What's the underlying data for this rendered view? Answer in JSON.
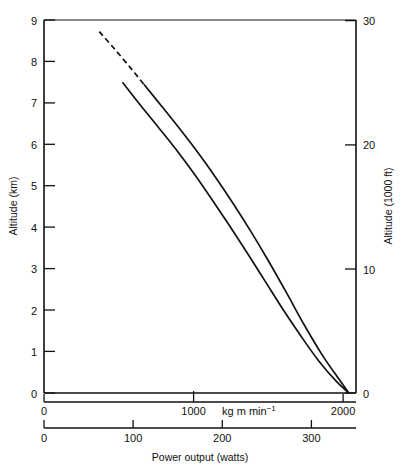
{
  "chart_data": {
    "type": "line",
    "title": "",
    "xlabel": "Power output  (watts)",
    "ylabel": "Altitude  (km)",
    "y2label": "Altitude  (1000 ft)",
    "x2label": "kg m min",
    "x2label_sup": "−1",
    "xlim": [
      0,
      350
    ],
    "ylim": [
      0,
      9
    ],
    "y2lim": [
      0,
      30
    ],
    "x2lim": [
      0,
      2100
    ],
    "grid": false,
    "legend": false,
    "x_ticks": [
      0,
      100,
      200,
      300
    ],
    "x_tick_labels": [
      "0",
      "100",
      "200",
      "300"
    ],
    "x2_ticks": [
      0,
      1000,
      2000
    ],
    "x2_tick_labels": [
      "0",
      "1000",
      "2000"
    ],
    "y_ticks": [
      0,
      1,
      2,
      3,
      4,
      5,
      6,
      7,
      8,
      9
    ],
    "y_tick_labels": [
      "0",
      "1",
      "2",
      "3",
      "4",
      "5",
      "6",
      "7",
      "8",
      "9"
    ],
    "y2_ticks": [
      0,
      10,
      20,
      30
    ],
    "y2_tick_labels": [
      "0",
      "10",
      "20",
      "30"
    ],
    "series": [
      {
        "name": "upper-curve",
        "style": "solid-with-dashed-extension",
        "dashed_segment": [
          {
            "x": 62,
            "y": 8.72
          },
          {
            "x": 80,
            "y": 8.28
          },
          {
            "x": 98,
            "y": 7.82
          },
          {
            "x": 112,
            "y": 7.45
          }
        ],
        "solid_segment": [
          {
            "x": 112,
            "y": 7.45
          },
          {
            "x": 132,
            "y": 6.92
          },
          {
            "x": 152,
            "y": 6.38
          },
          {
            "x": 172,
            "y": 5.82
          },
          {
            "x": 192,
            "y": 5.22
          },
          {
            "x": 212,
            "y": 4.58
          },
          {
            "x": 232,
            "y": 3.9
          },
          {
            "x": 252,
            "y": 3.18
          },
          {
            "x": 272,
            "y": 2.42
          },
          {
            "x": 292,
            "y": 1.64
          },
          {
            "x": 312,
            "y": 0.92
          },
          {
            "x": 330,
            "y": 0.36
          },
          {
            "x": 342,
            "y": 0.0
          }
        ]
      },
      {
        "name": "lower-curve",
        "style": "solid",
        "solid_segment": [
          {
            "x": 88,
            "y": 7.5
          },
          {
            "x": 108,
            "y": 6.95
          },
          {
            "x": 128,
            "y": 6.42
          },
          {
            "x": 148,
            "y": 5.88
          },
          {
            "x": 168,
            "y": 5.3
          },
          {
            "x": 188,
            "y": 4.68
          },
          {
            "x": 208,
            "y": 4.04
          },
          {
            "x": 228,
            "y": 3.38
          },
          {
            "x": 248,
            "y": 2.7
          },
          {
            "x": 268,
            "y": 2.02
          },
          {
            "x": 288,
            "y": 1.38
          },
          {
            "x": 308,
            "y": 0.78
          },
          {
            "x": 328,
            "y": 0.28
          },
          {
            "x": 342,
            "y": 0.0
          }
        ]
      }
    ]
  }
}
